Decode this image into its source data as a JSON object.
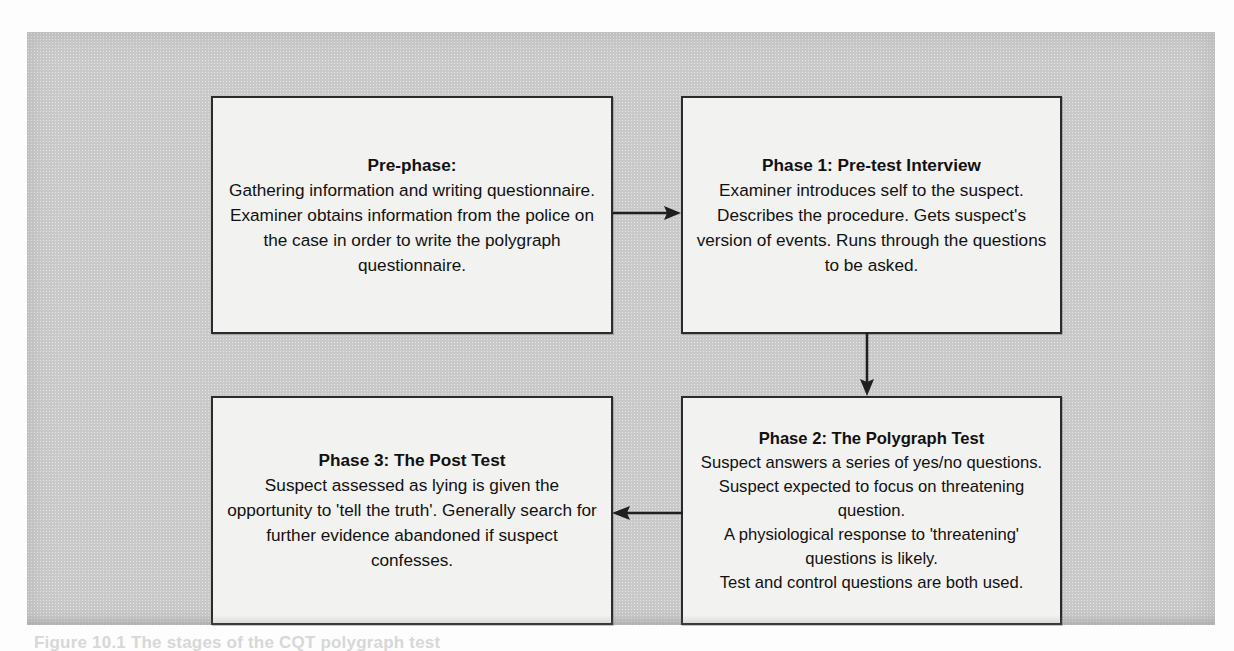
{
  "figure": {
    "type": "flowchart",
    "orientation": "two-by-two grid, clockwise flow",
    "caption_ghost": "Figure 10.1 The stages of the CQT polygraph test",
    "colors": {
      "panel_background": "#c9c9c9",
      "node_fill": "#f2f2f0",
      "node_border": "#2b2b2b",
      "text": "#111111",
      "arrow": "#1f1f1f"
    }
  },
  "nodes": [
    {
      "id": "prephase",
      "title": "Pre-phase:",
      "body": "Gathering information and writing questionnaire. Examiner obtains information from the police on the case in order to write the polygraph questionnaire.",
      "position": "top-left"
    },
    {
      "id": "phase1",
      "title": "Phase 1: Pre-test Interview",
      "body": "Examiner introduces self to the suspect. Describes the procedure. Gets suspect's version of events. Runs through the questions to be asked.",
      "position": "top-right"
    },
    {
      "id": "phase2",
      "title": "Phase 2: The Polygraph Test",
      "body": "Suspect answers a series of yes/no questions.\nSuspect expected to focus on threatening question.\nA physiological response to 'threatening' questions is likely.\nTest and control questions are both used.",
      "position": "bottom-right"
    },
    {
      "id": "phase3",
      "title": "Phase 3: The Post Test",
      "body": "Suspect assessed as lying is given the opportunity to 'tell the truth'. Generally search for further evidence abandoned if suspect confesses.",
      "position": "bottom-left"
    }
  ],
  "connectors": [
    {
      "id": "prephase-to-phase1",
      "from": "prephase",
      "to": "phase1",
      "direction": "right",
      "icon": "arrow-right-icon"
    },
    {
      "id": "phase1-to-phase2",
      "from": "phase1",
      "to": "phase2",
      "direction": "down",
      "icon": "arrow-down-icon"
    },
    {
      "id": "phase2-to-phase3",
      "from": "phase2",
      "to": "phase3",
      "direction": "left",
      "icon": "arrow-left-icon"
    }
  ]
}
